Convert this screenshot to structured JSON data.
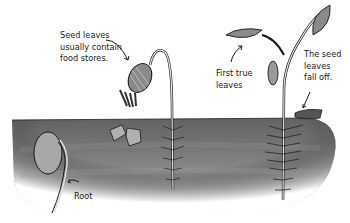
{
  "diagram": {
    "labels": {
      "seed_leaves": "Seed leaves\nusually contain\nfood stores.",
      "first_true_leaves": "First true\nleaves",
      "seed_leaves_fall": "The seed\nleaves\nfall off.",
      "root": "Root"
    },
    "stages": [
      {
        "name": "seed-with-root"
      },
      {
        "name": "seedling-with-seed-leaves"
      },
      {
        "name": "young-plant-with-true-leaves"
      }
    ],
    "colors": {
      "soil_top": "#6e6e6e",
      "soil_bottom": "#b5b5b5",
      "seed_fill": "#a8a8a8",
      "outline": "#1a1a1a",
      "background": "#ffffff"
    }
  }
}
